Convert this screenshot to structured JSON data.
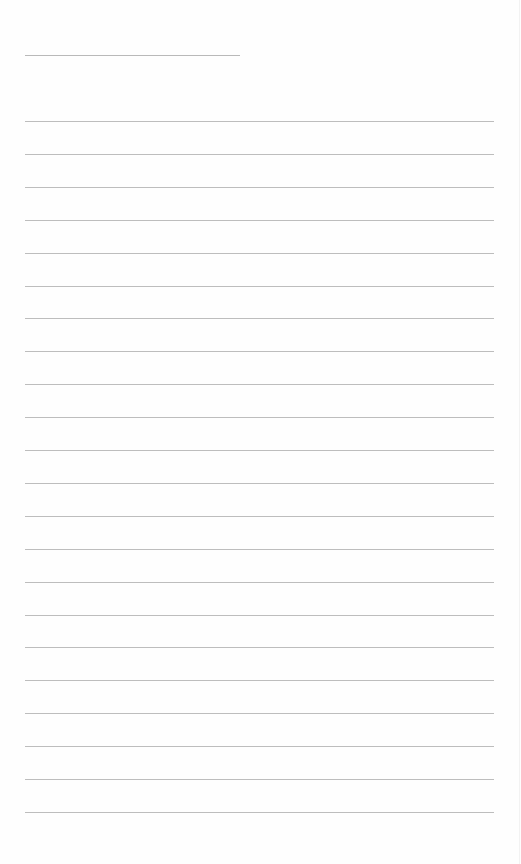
{
  "document": {
    "type": "blank lined writing sheet",
    "background_color": "#fefefe",
    "line_color": "#bdbdbd",
    "header_line": {
      "label": "",
      "left": 25,
      "top": 55,
      "width": 215
    },
    "ruled_lines": {
      "count": 22,
      "left": 25,
      "width": 469,
      "first_top": 121,
      "spacing": 32.9,
      "values": [
        "",
        "",
        "",
        "",
        "",
        "",
        "",
        "",
        "",
        "",
        "",
        "",
        "",
        "",
        "",
        "",
        "",
        "",
        "",
        "",
        "",
        ""
      ]
    }
  }
}
